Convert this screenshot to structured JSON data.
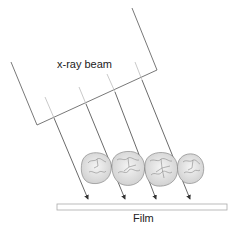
{
  "diagram": {
    "beam_label": "x-ray beam",
    "film_label": "Film",
    "ray_count": 4,
    "teeth": [
      {
        "name": "tooth-1"
      },
      {
        "name": "tooth-2"
      },
      {
        "name": "tooth-3"
      },
      {
        "name": "tooth-4"
      }
    ],
    "colors": {
      "beam_outline": "#555555",
      "ray_inside": "#bbbbbb",
      "ray_outside": "#444444",
      "tooth_fill": "#e4e4e4",
      "tooth_outline": "#8a8a8a",
      "film_outline": "#aaaaaa"
    }
  }
}
